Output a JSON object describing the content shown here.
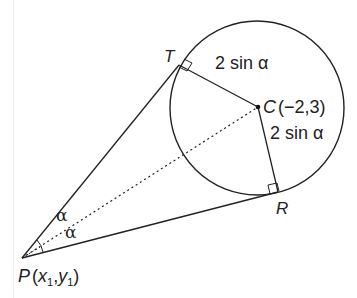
{
  "diagram": {
    "type": "geometry",
    "points": {
      "T": {
        "label": "T"
      },
      "R": {
        "label": "R"
      },
      "C": {
        "label": "C",
        "coords": "(−2,3)"
      },
      "P": {
        "label": "P",
        "coords_prefix": "(",
        "x": "x",
        "sub1": "1",
        "comma": ",",
        "y": "y",
        "sub2": "1",
        "coords_suffix": ")"
      }
    },
    "segment_labels": {
      "CT": "2 sin α",
      "CR": "2 sin α"
    },
    "angle_labels": {
      "upper": "α",
      "lower": "α"
    },
    "elements": [
      "circle centre C",
      "tangent PT",
      "tangent PR",
      "radius CT (right angle at T)",
      "radius CR (right angle at R)",
      "dotted line PC bisecting angle TPR"
    ],
    "colors": {
      "stroke": "#222222",
      "background": "#ffffff"
    }
  }
}
